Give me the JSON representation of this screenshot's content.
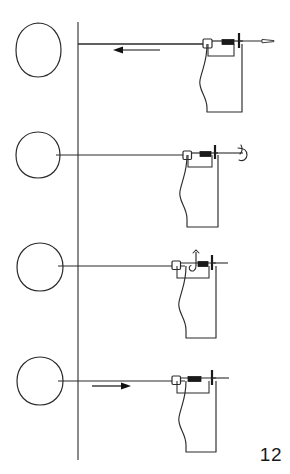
{
  "figure": {
    "page_number": "12",
    "stroke_color": "#2b2b2b",
    "fill_color": "#ffffff",
    "background_color": "#ffffff",
    "accent_dark": "#111111",
    "panel_count": 4,
    "axis": {
      "name": "vertical-reference-line",
      "x": 78,
      "y_top": 22,
      "y_bottom": 460
    },
    "panels": [
      {
        "id": "panel-1",
        "label": "",
        "oval": {
          "cx": 38,
          "cy": 50,
          "rx": 22,
          "ry": 26
        },
        "baseline_y": 44,
        "line_x_start": 78,
        "line_x_end": 247,
        "arrow": {
          "direction": "left",
          "x_tip": 115,
          "x_tail": 160,
          "y": 50
        },
        "tip_style": "straight-needle",
        "body": {
          "x_left": 207,
          "x_right": 242,
          "y_top": 44,
          "y_bottom": 112
        }
      },
      {
        "id": "panel-2",
        "label": "",
        "oval": {
          "cx": 38,
          "cy": 155,
          "rx": 22,
          "ry": 23
        },
        "baseline_y": 155,
        "line_x_start": 56,
        "line_x_end": 243,
        "arrow": null,
        "tip_style": "hooked-needle",
        "body": {
          "x_left": 187,
          "x_right": 218,
          "y_top": 155,
          "y_bottom": 227
        }
      },
      {
        "id": "panel-3",
        "label": "",
        "oval": {
          "cx": 40,
          "cy": 267,
          "rx": 23,
          "ry": 24
        },
        "baseline_y": 266,
        "line_x_start": 58,
        "line_x_end": 227,
        "arrow": null,
        "tip_style": "straight-needle-curl-above",
        "body": {
          "x_left": 186,
          "x_right": 216,
          "y_top": 266,
          "y_bottom": 338
        }
      },
      {
        "id": "panel-4",
        "label": "",
        "oval": {
          "cx": 40,
          "cy": 381,
          "rx": 23,
          "ry": 24
        },
        "baseline_y": 381,
        "line_x_start": 58,
        "line_x_end": 228,
        "arrow": {
          "direction": "right",
          "x_tip": 130,
          "x_tail": 92,
          "y": 386
        },
        "tip_style": "straight-needle",
        "body": {
          "x_left": 186,
          "x_right": 216,
          "y_top": 381,
          "y_bottom": 452
        }
      }
    ]
  }
}
